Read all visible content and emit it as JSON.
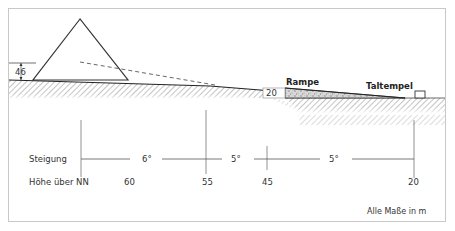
{
  "labels": {
    "pyramid_height": "46",
    "ramp": "Rampe",
    "ramp_height": "20",
    "valley_temple": "Taltempel",
    "slope_row": "Steigung",
    "elevation_row": "Höhe über NN",
    "units_note": "Alle Maße in m"
  },
  "slopes": [
    "6°",
    "5°",
    "5°"
  ],
  "elevations": [
    "60",
    "55",
    "45",
    "20"
  ],
  "colors": {
    "line": "#333333",
    "hatch": "#888888",
    "frame": "#cccccc",
    "ramp_fill": "#d4d4d4"
  }
}
